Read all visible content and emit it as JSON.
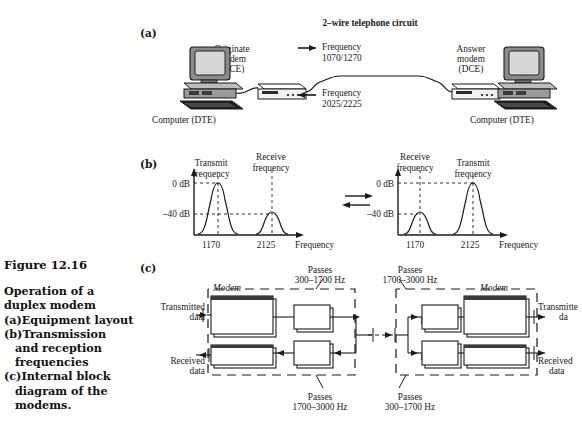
{
  "figure": {
    "number": "Figure 12.16",
    "title_lines": [
      "Operation of a",
      "duplex modem"
    ],
    "items": [
      {
        "marker": "(a)",
        "lines": [
          "Equipment layout"
        ]
      },
      {
        "marker": "(b)",
        "lines": [
          "Transmission",
          "and  reception",
          "frequencies"
        ]
      },
      {
        "marker": "(c)",
        "lines": [
          "Internal block",
          "diagram of the",
          "modems."
        ]
      }
    ]
  },
  "section_labels": {
    "a": "(a)",
    "b": "(b)",
    "c": "(c)"
  },
  "panel_a": {
    "circuit_title": "2–wire telephone circuit",
    "left_computer": "Computer (DTE)",
    "right_computer": "Computer (DTE)",
    "left_modem": [
      "Originate",
      "modem",
      "(DCE)"
    ],
    "right_modem": [
      "Answer",
      "modem",
      "(DCE)"
    ],
    "forward": {
      "label": "Frequency",
      "value": "1070/1270"
    },
    "reverse": {
      "label": "Frequency",
      "value": "2025/2225"
    }
  },
  "panel_b": {
    "axis_labels": {
      "top": "0 dB",
      "bottom": "–40 dB"
    },
    "x_axis_title": "Frequency",
    "left_chart": {
      "peaks": [
        {
          "label": "Transmit frequency",
          "tick": "1170",
          "level_db": 0
        },
        {
          "label": "Receive frequency",
          "tick": "2125",
          "level_db": -40
        }
      ]
    },
    "right_chart": {
      "peaks": [
        {
          "label": "Receive frequency",
          "tick": "1170",
          "level_db": -40
        },
        {
          "label": "Transmit frequency",
          "tick": "2125",
          "level_db": 0
        }
      ]
    }
  },
  "panel_c": {
    "modem_label": "Modem",
    "left": {
      "modulator": [
        "Modulator",
        "( originate",
        "frequencies )"
      ],
      "demodulator": "Demodulator",
      "filter_top": "Filter",
      "filter_bottom": "Filter",
      "transmitted": [
        "Transmitted",
        "data"
      ],
      "received": [
        "Received",
        "data"
      ]
    },
    "right": {
      "modulator": [
        "Modulator",
        "( answer",
        "frequencies )"
      ],
      "demodulator": "Demodulator",
      "filter_top": "Filter",
      "filter_bottom": "Filter",
      "transmitted": [
        "Transmitte",
        "da"
      ],
      "received": [
        "Received",
        "data"
      ]
    },
    "passes": {
      "top_left": [
        "Passes",
        "300–1700 Hz"
      ],
      "top_right": [
        "Passes",
        "1700–3000 Hz"
      ],
      "bottom_left": [
        "Passes",
        "1700–3000 Hz"
      ],
      "bottom_right": [
        "Passes",
        "300–1700 Hz"
      ]
    }
  },
  "colors": {
    "ink": "#1a1a1a",
    "paper": "#ffffff",
    "screen": "#d6d6d6",
    "case": "#8a8a8a"
  }
}
